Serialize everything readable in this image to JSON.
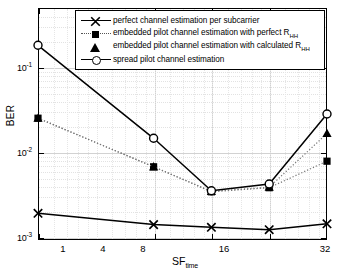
{
  "chart_data": {
    "type": "line",
    "title": "",
    "xlabel": "SF_time",
    "xlabel_base": "SF",
    "xlabel_sub": "time",
    "ylabel": "BER",
    "x": [
      1,
      4,
      8,
      16,
      32
    ],
    "xticklabels": [
      "1",
      "4",
      "8",
      "16",
      "32"
    ],
    "yticklabels": [
      "10-1",
      "10-2",
      "10-3"
    ],
    "ytickvalues": [
      0.1,
      0.01,
      0.001
    ],
    "xscale": "log2",
    "yscale": "log",
    "xlim": [
      1,
      32
    ],
    "ylim": [
      0.001,
      0.3
    ],
    "grid": true,
    "legend_position": "top-right",
    "series": [
      {
        "name": "perfect channel estimation per subcarrier",
        "marker": "x",
        "linestyle": "solid",
        "color": "#000000",
        "values": [
          0.0019,
          0.0014,
          0.0013,
          0.00122,
          0.00143
        ]
      },
      {
        "name": "embedded pilot channel estimation with perfect R_HH",
        "name_base": "embedded pilot channel estimation with perfect R",
        "name_sub": "HH",
        "marker": "square",
        "linestyle": "dotted",
        "color": "#000000",
        "values": [
          0.025,
          0.0067,
          0.0034,
          0.0038,
          0.0078
        ]
      },
      {
        "name": "embedded pilot channel estimation with calculated R_HH",
        "name_base": "embedded pilot channel estimation with calculated R",
        "name_sub": "HH",
        "marker": "triangle",
        "linestyle": "dotted",
        "color": "#000000",
        "values": [
          0.025,
          0.0067,
          0.00345,
          0.00385,
          0.0165
        ]
      },
      {
        "name": "spread pilot channel estimation",
        "marker": "circle",
        "linestyle": "solid",
        "color": "#000000",
        "values": [
          0.18,
          0.0145,
          0.0035,
          0.0042,
          0.028
        ]
      }
    ]
  }
}
